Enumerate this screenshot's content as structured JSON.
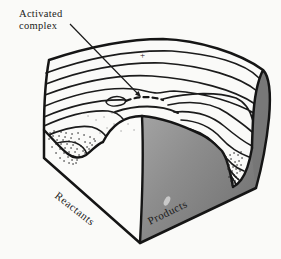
{
  "figure": {
    "background_color": "#fafaf8",
    "ink_color": "#1b1b1b",
    "callout": {
      "line1": "Activated",
      "line2": "complex"
    },
    "labels": {
      "reactants": "Reactants",
      "products": "Products"
    },
    "plus_mark": "+",
    "colors": {
      "surface_white": "#fbfbf9",
      "hill_face_light": "#a2a2a2",
      "hill_face_mid": "#8d8d8d",
      "hill_face_dark": "#787878",
      "right_edge_face": "#757575",
      "speck": "#d3d3d3"
    }
  }
}
